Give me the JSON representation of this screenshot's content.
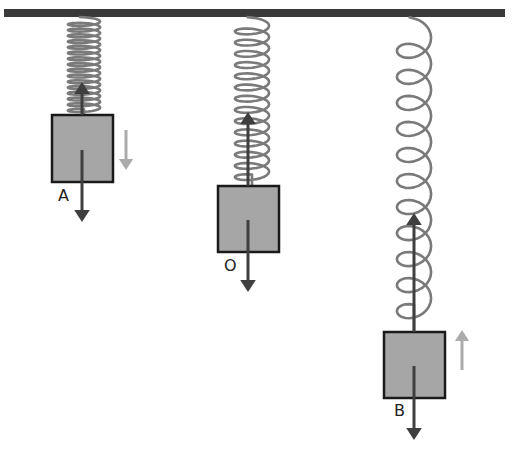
{
  "diagram": {
    "type": "spring-mass oscillation",
    "ceiling": {
      "x1": 4,
      "x2": 505,
      "y": 9,
      "height": 8,
      "color": "#3a3a3a"
    },
    "colors": {
      "spring": "#7a7a7a",
      "block_fill": "#a6a6a6",
      "block_stroke": "#1a1a1a",
      "force_arrow": "#3f3f3f",
      "velocity_arrow": "#ababab"
    },
    "positions": [
      {
        "label": "A",
        "description": "top position, compressed spring",
        "spring": {
          "cx": 84,
          "top": 17,
          "bottom": 115,
          "width": 34,
          "coils": 16
        },
        "block": {
          "x": 52,
          "y": 115,
          "w": 61,
          "h": 67
        },
        "spring_force_arrow": {
          "x": 82,
          "from": 115,
          "to": 82
        },
        "gravity_arrow": {
          "x": 82,
          "from": 150,
          "to": 222
        },
        "velocity_arrow": {
          "x": 126,
          "from": 130,
          "to": 170,
          "direction": "down"
        },
        "label_pos": {
          "x": 58,
          "y": 188
        }
      },
      {
        "label": "O",
        "description": "equilibrium position",
        "spring": {
          "cx": 252,
          "top": 17,
          "bottom": 186,
          "width": 36,
          "coils": 14
        },
        "block": {
          "x": 218,
          "y": 186,
          "w": 61,
          "h": 66
        },
        "spring_force_arrow": {
          "x": 248,
          "from": 186,
          "to": 112
        },
        "gravity_arrow": {
          "x": 248,
          "from": 220,
          "to": 292
        },
        "velocity_arrow": null,
        "label_pos": {
          "x": 224,
          "y": 258
        }
      },
      {
        "label": "B",
        "description": "bottom position, stretched spring",
        "spring": {
          "cx": 414,
          "top": 17,
          "bottom": 332,
          "width": 36,
          "coils": 11
        },
        "block": {
          "x": 384,
          "y": 332,
          "w": 61,
          "h": 66
        },
        "spring_force_arrow": {
          "x": 414,
          "from": 332,
          "to": 213
        },
        "gravity_arrow": {
          "x": 414,
          "from": 366,
          "to": 440
        },
        "velocity_arrow": {
          "x": 462,
          "from": 370,
          "to": 330,
          "direction": "up"
        },
        "label_pos": {
          "x": 394,
          "y": 403
        }
      }
    ]
  }
}
